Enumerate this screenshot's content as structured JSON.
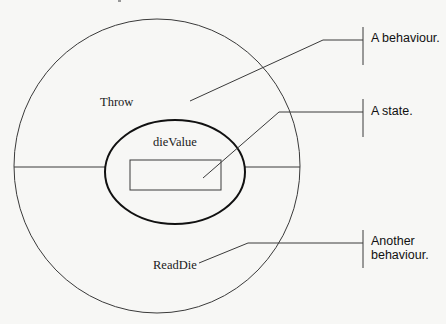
{
  "diagram": {
    "type": "object-structure",
    "outer_object": {
      "behaviours": [
        "Throw",
        "ReadDie"
      ]
    },
    "inner_state": {
      "label": "dieValue"
    },
    "callouts": [
      {
        "id": "behaviour",
        "text_lines": [
          "A behaviour."
        ],
        "points_to": "Throw"
      },
      {
        "id": "state",
        "text_lines": [
          "A state."
        ],
        "points_to": "dieValue"
      },
      {
        "id": "another-behaviour",
        "text_lines": [
          "Another",
          "behaviour."
        ],
        "points_to": "ReadDie"
      }
    ]
  },
  "labels": {
    "throw": "Throw",
    "die_value": "dieValue",
    "read_die": "ReadDie",
    "callout_behaviour": "A behaviour.",
    "callout_state": "A state.",
    "callout_another_line1": "Another",
    "callout_another_line2": "behaviour."
  },
  "colors": {
    "background": "#f7f7f5",
    "line": "#3a3a3a",
    "emphasis_line": "#111111"
  }
}
